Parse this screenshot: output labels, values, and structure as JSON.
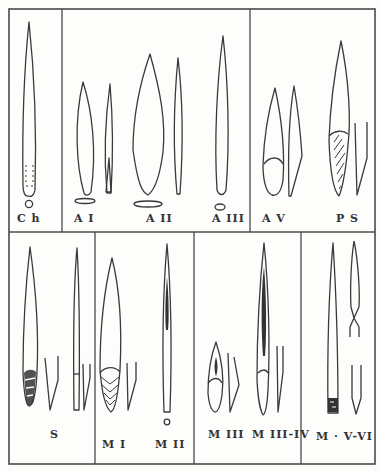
{
  "figure": {
    "rows": [
      {
        "row": "top",
        "panels": [
          {
            "id": "ch",
            "label": "C h",
            "items": [
              "elongated-point-with-retouched-base",
              "cross-section-circle"
            ]
          },
          {
            "id": "a",
            "labels": [
              "A I",
              "A II",
              "A III"
            ],
            "items": [
              "leaf-point-AI",
              "profile-AI",
              "cross-section-AI",
              "leaf-point-AII",
              "profile-AII",
              "cross-section-AII",
              "needle-point-AIII",
              "cross-section-AIII"
            ]
          },
          {
            "id": "av-ps",
            "labels": [
              "A V",
              "P S"
            ],
            "items": [
              "point-AV-front",
              "point-AV-profile",
              "point-PS-hatched",
              "profile-PS"
            ]
          }
        ]
      },
      {
        "row": "bottom",
        "panels": [
          {
            "id": "s",
            "label": "S",
            "items": [
              "point-S-front",
              "profile-S",
              "needle-S",
              "profile-S2"
            ]
          },
          {
            "id": "m-i-ii",
            "labels": [
              "M I",
              "M II"
            ],
            "items": [
              "point-MI-hatched",
              "profile-MI",
              "needle-MII",
              "cross-section-MII"
            ]
          },
          {
            "id": "m-iii-iv",
            "labels": [
              "M III",
              "M III-IV"
            ],
            "items": [
              "point-MIII",
              "profile-MIII",
              "needle-MIII-IV",
              "profile-MIII-IV"
            ]
          },
          {
            "id": "m-v-vi",
            "label": "M  · V-VI",
            "items": [
              "long-point-MV",
              "notched-point-MVI",
              "profile-MVI"
            ]
          }
        ]
      }
    ],
    "labels": {
      "ch": "C h",
      "a1": "A I",
      "a2": "A II",
      "a3": "A III",
      "av": "A V",
      "ps": "P S",
      "s": "S",
      "m1": "M I",
      "m2": "M II",
      "m3": "M III",
      "m34": "M III-IV",
      "m56": "M  · V-VI"
    },
    "colors": {
      "ink": "#3a3a3a",
      "paper": "#fdfdfb"
    }
  }
}
